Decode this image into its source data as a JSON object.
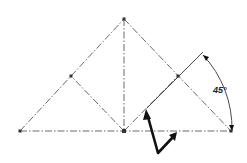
{
  "diagram": {
    "type": "geometric construction",
    "angle_label": "45°",
    "points": {
      "apex": [
        124,
        19
      ],
      "bottom_left": [
        20,
        131
      ],
      "bottom_center": [
        124,
        131
      ],
      "bottom_right": [
        231,
        131
      ],
      "left_mid": [
        71,
        76
      ],
      "right_mid": [
        178,
        76
      ]
    },
    "colors": {
      "construction_line": "#6a6a6a",
      "arrow": "#111111",
      "text": "#222222"
    }
  }
}
